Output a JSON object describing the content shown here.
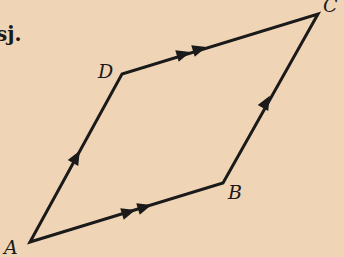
{
  "fragment_text": "sj.",
  "vertices": {
    "A": {
      "label": "A",
      "x": 30,
      "y": 242
    },
    "B": {
      "label": "B",
      "x": 223,
      "y": 183
    },
    "C": {
      "label": "C",
      "x": 318,
      "y": 14
    },
    "D": {
      "label": "D",
      "x": 122,
      "y": 74
    }
  },
  "edges": [
    {
      "from": "A",
      "to": "B",
      "arrows": 2
    },
    {
      "from": "D",
      "to": "C",
      "arrows": 2
    },
    {
      "from": "A",
      "to": "D",
      "arrows": 1
    },
    {
      "from": "B",
      "to": "C",
      "arrows": 1
    }
  ],
  "colors": {
    "background": "#f0d4b6",
    "ink": "#1a1a1a"
  }
}
